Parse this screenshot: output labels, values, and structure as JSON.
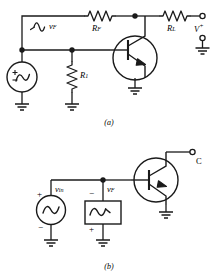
{
  "figure": {
    "background": "#ffffff",
    "line_color": "#1a1a1a",
    "panels": [
      {
        "caption": "(a)",
        "labels": {
          "feedback_voltage": "v",
          "feedback_voltage_sub": "F",
          "feedback_resistor": "R",
          "feedback_resistor_sub": "F",
          "bias_resistor": "R",
          "bias_resistor_sub": "1",
          "load_resistor": "R",
          "load_resistor_sub": "L",
          "supply_terminal": "V",
          "supply_terminal_sup": "+"
        },
        "components": [
          {
            "name": "ac-voltage-source",
            "symbol": "circle-sine-plusminus"
          },
          {
            "name": "feedback-resistor",
            "symbol": "zigzag-resistor"
          },
          {
            "name": "bias-resistor",
            "symbol": "zigzag-resistor"
          },
          {
            "name": "load-resistor",
            "symbol": "zigzag-resistor"
          },
          {
            "name": "npn-transistor",
            "symbol": "bjt-npn-circled"
          },
          {
            "name": "ground",
            "symbol": "earth-ground",
            "count": 4
          },
          {
            "name": "junction-node",
            "symbol": "filled-dot",
            "count": 3
          },
          {
            "name": "open-terminal",
            "symbol": "open-circle",
            "count": 2
          }
        ]
      },
      {
        "caption": "(b)",
        "labels": {
          "input_voltage": "v",
          "input_voltage_sub": "in",
          "feedback_voltage": "v",
          "feedback_voltage_sub": "F",
          "collector_terminal": "C",
          "source_polarity_top": "+",
          "source_polarity_bottom": "−",
          "feedback_polarity_top": "−",
          "feedback_polarity_bottom": "+"
        },
        "components": [
          {
            "name": "ac-voltage-source",
            "symbol": "circle-sine"
          },
          {
            "name": "feedback-source-box",
            "symbol": "rect-sine"
          },
          {
            "name": "npn-transistor",
            "symbol": "bjt-npn-circled"
          },
          {
            "name": "ground",
            "symbol": "earth-ground",
            "count": 3
          },
          {
            "name": "junction-node",
            "symbol": "filled-dot",
            "count": 1
          },
          {
            "name": "open-terminal",
            "symbol": "open-circle",
            "count": 1
          }
        ]
      }
    ]
  }
}
